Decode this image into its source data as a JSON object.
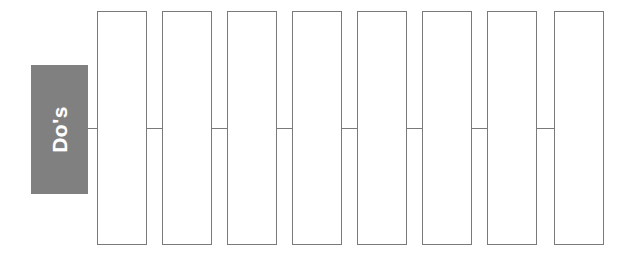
{
  "diagram": {
    "type": "process-chevron-sequence",
    "background_color": "#ffffff",
    "label_block": {
      "text": "Do's",
      "fill_color": "#808080",
      "text_color": "#ffffff",
      "rotation_degrees": -90,
      "bold": true
    },
    "step_box_style": {
      "fill_color": "#ffffff",
      "border_color": "#7a7a7a",
      "border_width_px": 1
    },
    "connector_style": {
      "color": "#7a7a7a",
      "width_px": 1
    },
    "step_count": 8,
    "steps": [
      {
        "index": 1,
        "text": ""
      },
      {
        "index": 2,
        "text": ""
      },
      {
        "index": 3,
        "text": ""
      },
      {
        "index": 4,
        "text": ""
      },
      {
        "index": 5,
        "text": ""
      },
      {
        "index": 6,
        "text": ""
      },
      {
        "index": 7,
        "text": ""
      },
      {
        "index": 8,
        "text": ""
      }
    ]
  }
}
